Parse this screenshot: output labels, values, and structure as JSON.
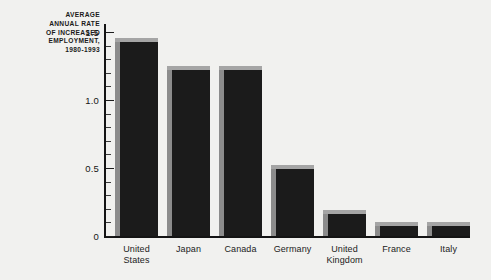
{
  "chart_data": {
    "type": "bar",
    "title": "AVERAGE ANNUAL RATE OF INCREASED EMPLOYMENT, 1980-1993",
    "title_lines": [
      "AVERAGE",
      "ANNUAL RATE",
      "OF INCREASED",
      "EMPLOYMENT,",
      "1980-1993"
    ],
    "categories": [
      "United States",
      "Japan",
      "Canada",
      "Germany",
      "United Kingdom",
      "France",
      "Italy"
    ],
    "category_lines": [
      [
        "United",
        "States"
      ],
      [
        "Japan"
      ],
      [
        "Canada"
      ],
      [
        "Germany"
      ],
      [
        "United",
        "Kingdom"
      ],
      [
        "France"
      ],
      [
        "Italy"
      ]
    ],
    "values": [
      1.43,
      1.22,
      1.22,
      0.49,
      0.16,
      0.07,
      0.07
    ],
    "xlabel": "",
    "ylabel": "",
    "ylim": [
      0,
      1.6
    ],
    "y_major_ticks": [
      0,
      0.5,
      1.0,
      1.5
    ],
    "y_major_tick_labels": [
      "0",
      "0.5",
      "1.0",
      "1.5"
    ],
    "y_minor_tick_step": 0.1,
    "grid": false,
    "legend": null,
    "colors": {
      "background": "#f1f1ef",
      "bar_face": "#1b1b1b",
      "bar_side": "#8c8c8c",
      "bar_cap": "#a5a5a5",
      "axis": "#141414",
      "text": "#1a1a1a"
    }
  }
}
